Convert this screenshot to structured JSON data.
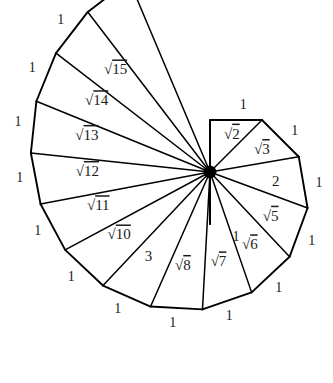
{
  "figure": {
    "name": "spiral-of-theodorus",
    "background_color": "#ffffff",
    "stroke_color": "#000000",
    "text_color": "#1a1a1a",
    "center_label": "",
    "hub": {
      "x": 210,
      "y": 172,
      "radius": 6
    }
  },
  "chart_data": {
    "type": "diagram",
    "subtype": "square-root-spiral",
    "unit_leg_length": 1,
    "center": {
      "x": 210,
      "y": 172
    },
    "scale_px_per_unit": 52,
    "start_angle_deg": 90,
    "triangle_count": 15,
    "hypotenuse_labels": [
      "1",
      "√2",
      "√3",
      "2",
      "√5",
      "√6",
      "√7",
      "√8",
      "3",
      "√10",
      "√11",
      "√12",
      "√13",
      "√14",
      "√15"
    ],
    "visible_hypotenuse_labels": [
      {
        "index": 2,
        "text": "√2",
        "radicand": "2"
      },
      {
        "index": 3,
        "text": "√3",
        "radicand": "3"
      },
      {
        "index": 4,
        "text": "2",
        "radicand": ""
      },
      {
        "index": 5,
        "text": "√5",
        "radicand": "5"
      },
      {
        "index": 6,
        "text": "√6",
        "radicand": "6"
      },
      {
        "index": 7,
        "text": "√7",
        "radicand": "7"
      },
      {
        "index": 8,
        "text": "√8",
        "radicand": "8"
      },
      {
        "index": 9,
        "text": "3",
        "radicand": ""
      },
      {
        "index": 10,
        "text": "√10",
        "radicand": "10"
      },
      {
        "index": 11,
        "text": "√11",
        "radicand": "11"
      },
      {
        "index": 12,
        "text": "√12",
        "radicand": "12"
      },
      {
        "index": 13,
        "text": "√13",
        "radicand": "13"
      },
      {
        "index": 14,
        "text": "√14",
        "radicand": "14"
      },
      {
        "index": 15,
        "text": "√15",
        "radicand": "15"
      }
    ],
    "outer_edge_label": "1",
    "outer_edge_label_count": 14,
    "radicand_values": [
      2,
      3,
      5,
      6,
      7,
      8,
      10,
      11,
      12,
      13,
      14,
      15
    ],
    "integer_hypotenuses": [
      {
        "index": 1,
        "value": "1"
      },
      {
        "index": 4,
        "value": "2"
      },
      {
        "index": 9,
        "value": "3"
      }
    ],
    "xlabel": "",
    "ylabel": "",
    "grid": false,
    "legend": false
  },
  "labels": {
    "unit": "1",
    "two": "2",
    "three": "3"
  }
}
